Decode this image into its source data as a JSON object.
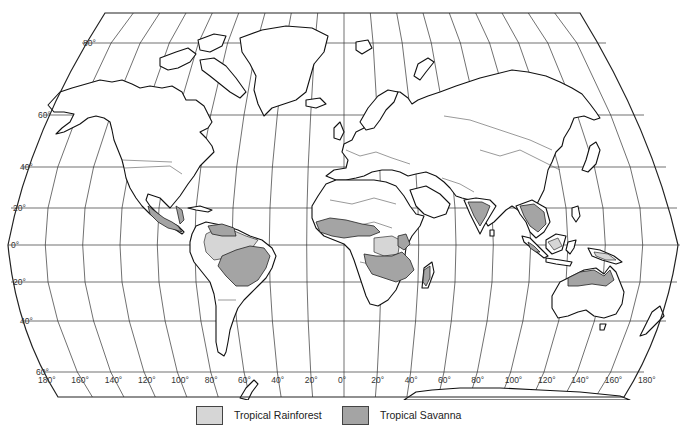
{
  "map": {
    "title": "World map of tropical rainforest and tropical savanna regions",
    "projection": "Robinson-style world projection",
    "latitude_labels": [
      {
        "text": "80°",
        "y": 43,
        "x": 83
      },
      {
        "text": "60°",
        "y": 115,
        "x": 38
      },
      {
        "text": "40°",
        "y": 167,
        "x": 20
      },
      {
        "text": "20°",
        "y": 208,
        "x": 13
      },
      {
        "text": "0°",
        "y": 245,
        "x": 11
      },
      {
        "text": "20°",
        "y": 282,
        "x": 13
      },
      {
        "text": "40°",
        "y": 321,
        "x": 20
      },
      {
        "text": "60°",
        "y": 372,
        "x": 36
      }
    ],
    "longitude_labels": [
      "180°",
      "160°",
      "140°",
      "120°",
      "100°",
      "80°",
      "60°",
      "40°",
      "20°",
      "0°",
      "20°",
      "40°",
      "60°",
      "80°",
      "100°",
      "120°",
      "140°",
      "160°",
      "180°"
    ],
    "colors": {
      "tropical_rainforest": "#d6d6d6",
      "tropical_savanna": "#a4a4a4",
      "land": "#ffffff",
      "outline": "#111111"
    }
  },
  "legend": {
    "items": [
      {
        "label": "Tropical Rainforest",
        "color": "#d6d6d6"
      },
      {
        "label": "Tropical Savanna",
        "color": "#a4a4a4"
      }
    ]
  }
}
